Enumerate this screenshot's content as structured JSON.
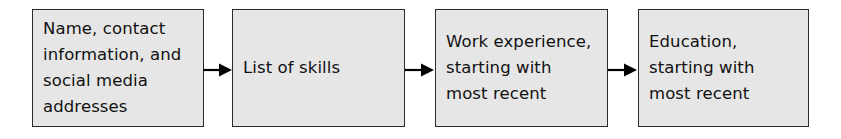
{
  "diagram": {
    "type": "flowchart",
    "orientation": "horizontal",
    "title": "",
    "colors": {
      "node_fill": "#e6e6e6",
      "node_border": "#2b2b2b",
      "text": "#111111",
      "background": "#ffffff",
      "arrow": "#000000"
    },
    "nodes": [
      {
        "id": "node-1",
        "label": "Name, contact\ninformation, and\nsocial media\naddresses"
      },
      {
        "id": "node-2",
        "label": "List of skills"
      },
      {
        "id": "node-3",
        "label": "Work experience,\nstarting with\nmost recent"
      },
      {
        "id": "node-4",
        "label": "Education,\nstarting with\nmost recent"
      }
    ],
    "connectors": [
      {
        "id": "arrow-1",
        "icon": "arrow-right-icon",
        "from": "node-1",
        "to": "node-2"
      },
      {
        "id": "arrow-2",
        "icon": "arrow-right-icon",
        "from": "node-2",
        "to": "node-3"
      },
      {
        "id": "arrow-3",
        "icon": "arrow-right-icon",
        "from": "node-3",
        "to": "node-4"
      }
    ]
  }
}
